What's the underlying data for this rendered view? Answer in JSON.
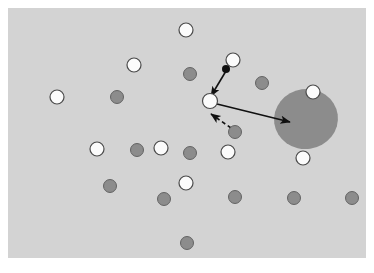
{
  "figure": {
    "width": 374,
    "height": 273,
    "page_background": "#ffffff"
  },
  "panel": {
    "name": "plot-panel",
    "x": 8,
    "y": 8,
    "width": 358,
    "height": 250,
    "fill": "#d3d3d3",
    "border": "none"
  },
  "colors": {
    "background": "#ffffff",
    "panel_fill": "#d3d3d3",
    "open_marker_fill": "#fbfbfb",
    "open_marker_stroke": "#4a4a4a",
    "filled_marker_fill": "#8c8c8c",
    "filled_marker_stroke": "#5a5a5a",
    "ellipse_fill": "#8c8c8c",
    "ellipse_stroke": "none",
    "focus_dot_fill": "#101010",
    "arrow_stroke": "#101010",
    "dashed_arrow_stroke": "#101010"
  },
  "chart_data": {
    "type": "scatter",
    "title": "",
    "xlabel": "",
    "ylabel": "",
    "xlim": [
      8,
      366
    ],
    "ylim": [
      8,
      258
    ],
    "grid": false,
    "legend": null,
    "axes_visible": false,
    "tick_labels": [],
    "marker_radius": {
      "open": 7,
      "filled": 6.5,
      "focus_dot": 4
    },
    "series": [
      {
        "name": "open-markers",
        "style": "open-circle",
        "fill": "#fbfbfb",
        "stroke": "#4a4a4a",
        "count": 11,
        "points": [
          {
            "id": "w1",
            "x": 186,
            "y": 30,
            "r": 7
          },
          {
            "id": "w2",
            "x": 233,
            "y": 60,
            "r": 7
          },
          {
            "id": "w3",
            "x": 134,
            "y": 65,
            "r": 7
          },
          {
            "id": "w4",
            "x": 57,
            "y": 97,
            "r": 7
          },
          {
            "id": "w5",
            "x": 210,
            "y": 101,
            "r": 7.5
          },
          {
            "id": "w6",
            "x": 313,
            "y": 92,
            "r": 7
          },
          {
            "id": "w7",
            "x": 97,
            "y": 149,
            "r": 7
          },
          {
            "id": "w8",
            "x": 161,
            "y": 148,
            "r": 7
          },
          {
            "id": "w9",
            "x": 228,
            "y": 152,
            "r": 7
          },
          {
            "id": "w10",
            "x": 303,
            "y": 158,
            "r": 7
          },
          {
            "id": "w11",
            "x": 186,
            "y": 183,
            "r": 7
          }
        ]
      },
      {
        "name": "filled-markers",
        "style": "filled-circle",
        "fill": "#8c8c8c",
        "stroke": "#5a5a5a",
        "count": 12,
        "points": [
          {
            "id": "g1",
            "x": 190,
            "y": 74,
            "r": 6.5
          },
          {
            "id": "g2",
            "x": 117,
            "y": 97,
            "r": 6.5
          },
          {
            "id": "g3",
            "x": 262,
            "y": 83,
            "r": 6.5
          },
          {
            "id": "g4",
            "x": 235,
            "y": 132,
            "r": 6.5
          },
          {
            "id": "g5",
            "x": 137,
            "y": 150,
            "r": 6.5
          },
          {
            "id": "g6",
            "x": 190,
            "y": 153,
            "r": 6.5
          },
          {
            "id": "g7",
            "x": 110,
            "y": 186,
            "r": 6.5
          },
          {
            "id": "g8",
            "x": 164,
            "y": 199,
            "r": 6.5
          },
          {
            "id": "g9",
            "x": 235,
            "y": 197,
            "r": 6.5
          },
          {
            "id": "g10",
            "x": 294,
            "y": 198,
            "r": 6.5
          },
          {
            "id": "g11",
            "x": 187,
            "y": 243,
            "r": 6.5
          },
          {
            "id": "g12",
            "x": 352,
            "y": 198,
            "r": 6.5
          }
        ]
      },
      {
        "name": "focus-dot",
        "style": "solid-dot",
        "fill": "#101010",
        "count": 1,
        "points": [
          {
            "id": "d1",
            "x": 226,
            "y": 69,
            "r": 4
          }
        ]
      }
    ],
    "ellipse": {
      "id": "cluster-ellipse",
      "cx": 306,
      "cy": 119,
      "rx": 32,
      "ry": 30,
      "rotation": -8,
      "fill": "#8c8c8c"
    },
    "arrows": [
      {
        "id": "arrow-incoming",
        "style": "solid",
        "x1": 226,
        "y1": 71,
        "x2": 211,
        "y2": 96,
        "stroke": "#101010",
        "stroke_width": 1.6,
        "head": "end"
      },
      {
        "id": "arrow-outgoing",
        "style": "solid",
        "x1": 217,
        "y1": 104,
        "x2": 290,
        "y2": 122,
        "stroke": "#101010",
        "stroke_width": 1.6,
        "head": "end"
      },
      {
        "id": "arrow-dashed-feedback",
        "style": "dashed",
        "x1": 231,
        "y1": 128,
        "x2": 211,
        "y2": 114,
        "stroke": "#101010",
        "stroke_width": 1.6,
        "dash": "4 3",
        "head": "end"
      }
    ]
  }
}
